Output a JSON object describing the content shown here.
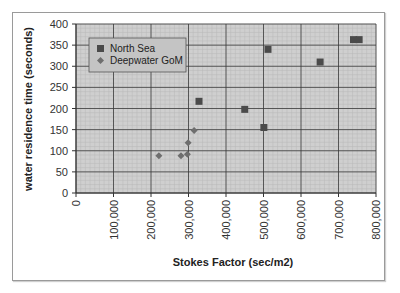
{
  "chart_data": {
    "type": "scatter",
    "title": "",
    "xlabel": "Stokes Factor (sec/m2)",
    "ylabel": "water residence time (seconds)",
    "xlim": [
      0,
      800000
    ],
    "ylim": [
      0,
      400
    ],
    "x_ticks": [
      "0",
      "100,000",
      "200,000",
      "300,000",
      "400,000",
      "500,000",
      "600,000",
      "700,000",
      "800,000"
    ],
    "y_ticks": [
      "0",
      "50",
      "100",
      "150",
      "200",
      "250",
      "300",
      "350",
      "400"
    ],
    "grid": true,
    "legend_position": "upper-left-inside",
    "series": [
      {
        "name": "North Sea",
        "marker": "square",
        "color": "#4a4a4a",
        "points": [
          {
            "x": 328000,
            "y": 217
          },
          {
            "x": 450000,
            "y": 198
          },
          {
            "x": 501000,
            "y": 155
          },
          {
            "x": 512000,
            "y": 340
          },
          {
            "x": 651000,
            "y": 310
          },
          {
            "x": 740000,
            "y": 363
          },
          {
            "x": 755000,
            "y": 363
          }
        ]
      },
      {
        "name": "Deepwater GoM",
        "marker": "diamond",
        "color": "#6e6e6e",
        "points": [
          {
            "x": 221000,
            "y": 88
          },
          {
            "x": 280000,
            "y": 88
          },
          {
            "x": 297000,
            "y": 92
          },
          {
            "x": 299000,
            "y": 119
          },
          {
            "x": 315000,
            "y": 148
          }
        ]
      }
    ]
  },
  "colors": {
    "plot_background": "#cfcfcf",
    "minor_grid": "#b8b8b8",
    "major_grid": "#3a3a3a",
    "legend_background": "#c4c4c4"
  }
}
